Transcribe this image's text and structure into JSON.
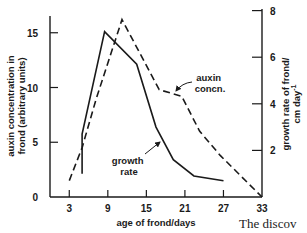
{
  "chart_data": {
    "type": "line",
    "title": "",
    "xlabel": "age of frond/days",
    "ylabel": "auxin concentration in frond (arbitrary units)",
    "ylabel_lines": [
      "auxin concentration in",
      "frond (arbitrary units)"
    ],
    "y2label": "growth rate of frond/ cm day-1",
    "y2label_lines": [
      "growth rate of frond/",
      "cm day"
    ],
    "y2label_superscript": "-1",
    "x_ticks": [
      3,
      9,
      15,
      21,
      27,
      33
    ],
    "y_ticks": [
      0,
      5,
      10,
      15
    ],
    "y2_ticks": [
      2,
      4,
      6,
      8
    ],
    "xlim": [
      0,
      33
    ],
    "ylim": [
      0,
      18
    ],
    "y2lim": [
      0,
      8.5
    ],
    "grid": false,
    "legend": "inline annotations",
    "series": [
      {
        "name": "auxin concn.",
        "axis": "left",
        "style": "dashed",
        "x": [
          3,
          5,
          7.2,
          11.2,
          17,
          20.5,
          23.3,
          26.5,
          33
        ],
        "values": [
          1.5,
          4.5,
          9.0,
          16.2,
          9.8,
          9.2,
          6.0,
          3.8,
          0
        ]
      },
      {
        "name": "growth rate",
        "axis": "right",
        "style": "solid",
        "x": [
          5,
          5,
          8.5,
          13.5,
          16.5,
          19.2,
          22.4,
          27
        ],
        "values": [
          1.0,
          2.7,
          7.1,
          5.7,
          3.0,
          1.6,
          0.9,
          0.7
        ]
      }
    ],
    "annotations": [
      {
        "text_lines": [
          "auxin",
          "concn."
        ],
        "points_to": "auxin concn."
      },
      {
        "text_lines": [
          "growth",
          "rate"
        ],
        "points_to": "growth rate"
      }
    ]
  },
  "page_fragment": "The discov"
}
